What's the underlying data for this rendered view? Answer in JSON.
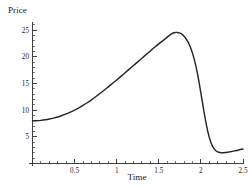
{
  "chart_data": {
    "type": "line",
    "title": "",
    "xlabel": "Time",
    "ylabel": "Price",
    "xlim": [
      0,
      2.5
    ],
    "ylim": [
      0,
      26.5
    ],
    "grid": false,
    "legend": null,
    "x_ticks": [
      {
        "value": 0.5,
        "label": "0.5"
      },
      {
        "value": 1.0,
        "label": "1"
      },
      {
        "value": 1.5,
        "label": "1.5"
      },
      {
        "value": 2.0,
        "label": "2"
      },
      {
        "value": 2.5,
        "label": "2.5"
      }
    ],
    "y_ticks": [
      {
        "value": 5,
        "label": "5"
      },
      {
        "value": 10,
        "label": "10"
      },
      {
        "value": 15,
        "label": "15"
      },
      {
        "value": 20,
        "label": "20"
      },
      {
        "value": 25,
        "label": "25"
      }
    ],
    "x_minor_step": 0.1,
    "y_minor_step": 1,
    "series": [
      {
        "name": "Price",
        "color": "#262626",
        "x": [
          0.0,
          0.05,
          0.1,
          0.15,
          0.2,
          0.25,
          0.3,
          0.35,
          0.4,
          0.45,
          0.5,
          0.55,
          0.6,
          0.65,
          0.7,
          0.75,
          0.8,
          0.85,
          0.9,
          0.95,
          1.0,
          1.05,
          1.1,
          1.15,
          1.2,
          1.25,
          1.3,
          1.35,
          1.4,
          1.45,
          1.5,
          1.55,
          1.6,
          1.65,
          1.68,
          1.72,
          1.76,
          1.8,
          1.84,
          1.88,
          1.92,
          1.96,
          2.0,
          2.04,
          2.08,
          2.12,
          2.16,
          2.2,
          2.25,
          2.3,
          2.35,
          2.4,
          2.45,
          2.5
        ],
        "y": [
          8.0,
          8.02,
          8.08,
          8.18,
          8.32,
          8.5,
          8.72,
          8.98,
          9.28,
          9.62,
          10.0,
          10.42,
          10.88,
          11.38,
          11.92,
          12.5,
          13.1,
          13.72,
          14.36,
          15.0,
          15.65,
          16.32,
          17.0,
          17.68,
          18.36,
          19.04,
          19.72,
          20.4,
          21.08,
          21.76,
          22.4,
          23.0,
          23.66,
          24.28,
          24.5,
          24.55,
          24.35,
          23.85,
          22.95,
          21.6,
          19.6,
          16.8,
          13.2,
          9.4,
          6.1,
          3.9,
          2.7,
          2.18,
          2.0,
          2.06,
          2.2,
          2.36,
          2.54,
          2.7
        ]
      }
    ]
  }
}
